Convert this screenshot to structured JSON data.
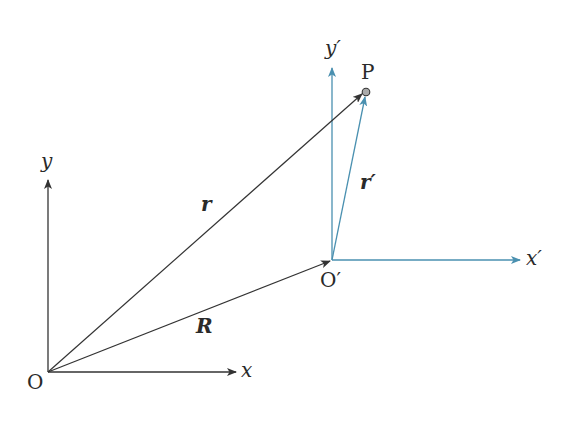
{
  "diagram": {
    "type": "coordinate-frames-vector-diagram",
    "colors": {
      "frame_S": "#333333",
      "frame_S_prime": "#4a90b0",
      "vector_r": "#333333",
      "vector_R": "#333333",
      "vector_r_prime": "#4a90b0",
      "point_fill": "#aaaaaa"
    },
    "frames": [
      {
        "name": "S",
        "origin_label": "O",
        "x_axis_label": "x",
        "y_axis_label": "y"
      },
      {
        "name": "S'",
        "origin_label": "O′",
        "x_axis_label": "x′",
        "y_axis_label": "y′"
      }
    ],
    "point": {
      "label": "P"
    },
    "vectors": [
      {
        "label": "r",
        "from": "O",
        "to": "P"
      },
      {
        "label": "R",
        "from": "O",
        "to": "O′"
      },
      {
        "label": "r′",
        "from": "O′",
        "to": "P"
      }
    ]
  }
}
